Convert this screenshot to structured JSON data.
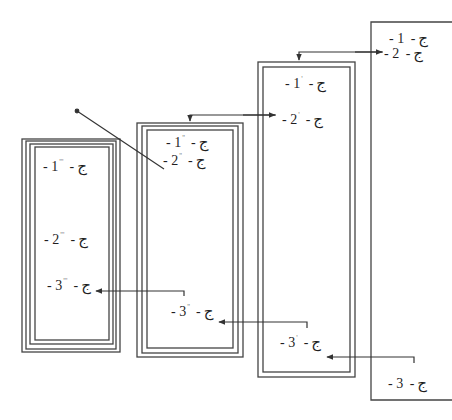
{
  "diagram": {
    "line_color": "#333333",
    "frames": [
      {
        "id": "frame-4",
        "border": "single-open",
        "items": [
          {
            "dash": "-",
            "num": "1",
            "prime": "",
            "sep": "-",
            "letter": "ج"
          },
          {
            "dash": "-",
            "num": "2",
            "prime": "",
            "sep": "-",
            "letter": "ج"
          },
          {
            "dash": "-",
            "num": "3",
            "prime": "",
            "sep": "-",
            "letter": "ج"
          }
        ]
      },
      {
        "id": "frame-3",
        "border": "double",
        "items": [
          {
            "dash": "-",
            "num": "1",
            "prime": "'",
            "sep": "-",
            "letter": "ج"
          },
          {
            "dash": "-",
            "num": "2",
            "prime": "'",
            "sep": "-",
            "letter": "ج"
          },
          {
            "dash": "-",
            "num": "3",
            "prime": "'",
            "sep": "-",
            "letter": "ج"
          }
        ]
      },
      {
        "id": "frame-2",
        "border": "triple",
        "items": [
          {
            "dash": "-",
            "num": "1",
            "prime": "''",
            "sep": "-",
            "letter": "ج"
          },
          {
            "dash": "-",
            "num": "2",
            "prime": "''",
            "sep": "-",
            "letter": "ج"
          },
          {
            "dash": "-",
            "num": "3",
            "prime": "''",
            "sep": "-",
            "letter": "ج"
          }
        ]
      },
      {
        "id": "frame-1",
        "border": "quadruple",
        "items": [
          {
            "dash": "-",
            "num": "1",
            "prime": "'''",
            "sep": "-",
            "letter": "ج"
          },
          {
            "dash": "-",
            "num": "2",
            "prime": "'''",
            "sep": "-",
            "letter": "ج"
          },
          {
            "dash": "-",
            "num": "3",
            "prime": "'''",
            "sep": "-",
            "letter": "ج"
          }
        ]
      }
    ],
    "connectors": [
      {
        "from": "frame-4 item 2",
        "to": "frame-3 top",
        "type": "arrow"
      },
      {
        "from": "frame-3 item 2",
        "to": "frame-2 top",
        "type": "arrow"
      },
      {
        "from": "frame-2 item 3",
        "to": "frame-1 item 3",
        "type": "arrow"
      },
      {
        "from": "frame-3 item 3",
        "to": "frame-2 item 3",
        "type": "arrow"
      },
      {
        "from": "frame-4 item 3",
        "to": "frame-3 item 3",
        "type": "arrow"
      },
      {
        "from": "free-point",
        "to": "frame-2 item 2",
        "type": "diagonal-line"
      }
    ]
  }
}
